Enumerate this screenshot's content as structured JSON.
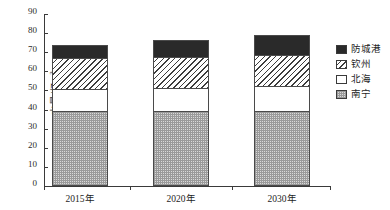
{
  "chart_data": {
    "type": "bar",
    "subtype": "stacked-bar",
    "title": "",
    "xlabel": "",
    "ylabel": "水量/亿m³",
    "categories": [
      "2015年",
      "2020年",
      "2030年"
    ],
    "ylim": [
      0,
      90
    ],
    "yticks": [
      0,
      10,
      20,
      30,
      40,
      50,
      60,
      70,
      80,
      90
    ],
    "ytick_labels": [
      "0",
      "10",
      "20",
      "30",
      "40",
      "50",
      "60",
      "70",
      "80",
      "90"
    ],
    "grid": false,
    "legend_position": "right",
    "series": [
      {
        "name": "南宁",
        "pattern": "dots",
        "values": [
          39.0,
          39.5,
          39.5
        ]
      },
      {
        "name": "北海",
        "pattern": "white",
        "values": [
          12.0,
          12.0,
          13.0
        ]
      },
      {
        "name": "钦州",
        "pattern": "hatch",
        "values": [
          16.0,
          16.0,
          16.0
        ]
      },
      {
        "name": "防城港",
        "pattern": "solid-dark",
        "values": [
          7.0,
          9.0,
          10.5
        ]
      }
    ],
    "stack_order_bottom_to_top": [
      "南宁",
      "北海",
      "钦州",
      "防城港"
    ],
    "totals": [
      74.0,
      76.5,
      79.0
    ],
    "colors": {
      "solid_dark": "#2a2a2a",
      "hatch": "#3d3d3d",
      "white": "#ffffff",
      "dots": "#d9d9d9",
      "axis": "#3a3a3a",
      "text": "#1e1e1e"
    }
  },
  "legend": {
    "items": [
      {
        "label": "防城港"
      },
      {
        "label": "钦州"
      },
      {
        "label": "北海"
      },
      {
        "label": "南宁"
      }
    ]
  },
  "yaxis": {
    "title_main": "水量/亿m",
    "title_sup": "3"
  }
}
